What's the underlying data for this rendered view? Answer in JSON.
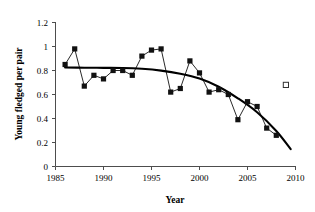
{
  "chart_data": {
    "type": "line",
    "title": "",
    "xlabel": "Year",
    "ylabel": "Young fledged per pair",
    "xlim": [
      1985,
      2010
    ],
    "ylim": [
      0,
      1.2
    ],
    "xticks": [
      "1985",
      "1990",
      "1995",
      "2000",
      "2005",
      "2010"
    ],
    "xtick_values": [
      1985,
      1990,
      1995,
      2000,
      2005,
      2010
    ],
    "yticks": [
      "0",
      "0.2",
      "0.4",
      "0.6",
      "0.8",
      "1",
      "1.2"
    ],
    "ytick_values": [
      0,
      0.2,
      0.4,
      0.6,
      0.8,
      1,
      1.2
    ],
    "grid": false,
    "legend": "none",
    "series": [
      {
        "name": "Young fledged per pair",
        "marker": "filled-square",
        "color": "#111111",
        "x": [
          1986,
          1987,
          1988,
          1989,
          1990,
          1991,
          1992,
          1993,
          1994,
          1995,
          1996,
          1997,
          1998,
          1999,
          2000,
          2001,
          2002,
          2003,
          2004,
          2005,
          2006,
          2007,
          2008
        ],
        "values": [
          0.85,
          0.98,
          0.67,
          0.76,
          0.73,
          0.8,
          0.8,
          0.76,
          0.92,
          0.97,
          0.98,
          0.62,
          0.65,
          0.88,
          0.78,
          0.62,
          0.64,
          0.6,
          0.39,
          0.54,
          0.5,
          0.32,
          0.26
        ]
      },
      {
        "name": "Open square point",
        "marker": "open-square",
        "color": "#ffffff",
        "x": [
          2009
        ],
        "values": [
          0.68
        ]
      },
      {
        "name": "Trend curve",
        "marker": "none",
        "color": "#000000",
        "x": [
          1986,
          1988,
          1990,
          1992,
          1994,
          1996,
          1998,
          2000,
          2002,
          2004,
          2006,
          2008,
          2009.5
        ],
        "values": [
          0.825,
          0.823,
          0.822,
          0.821,
          0.814,
          0.799,
          0.773,
          0.733,
          0.665,
          0.568,
          0.452,
          0.296,
          0.145
        ]
      }
    ]
  }
}
